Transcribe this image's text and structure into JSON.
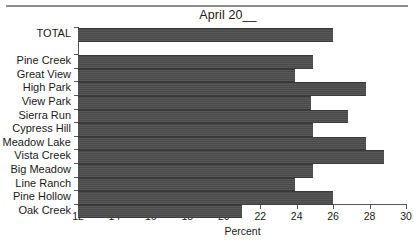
{
  "chart_data": {
    "type": "bar",
    "orientation": "horizontal",
    "title": "April 20__",
    "xlabel": "Percent",
    "ylabel": "",
    "xlim": [
      12,
      30
    ],
    "xticks": [
      12,
      14,
      16,
      18,
      20,
      22,
      24,
      26,
      28,
      30
    ],
    "xtick_labels": [
      "12",
      "14",
      "16",
      "18",
      "20",
      "22",
      "24",
      "26",
      "28",
      "30"
    ],
    "grid": false,
    "legend": null,
    "bar_color": "#4d4d4d",
    "categories": [
      "TOTAL",
      "Pine Creek",
      "Great View",
      "High Park",
      "View Park",
      "Sierra Run",
      "Cypress Hill",
      "Meadow Lake",
      "Vista Creek",
      "Big Meadow",
      "Line Ranch",
      "Pine Hollow",
      "Oak Creek"
    ],
    "values": [
      26.0,
      24.9,
      23.9,
      27.8,
      24.8,
      26.8,
      24.9,
      27.8,
      28.8,
      24.9,
      23.9,
      26.0,
      21.0
    ],
    "bars": [
      {
        "label": "TOTAL",
        "value": 26.0,
        "group": "total"
      },
      {
        "label": "Pine Creek",
        "value": 24.9,
        "group": "items"
      },
      {
        "label": "Great View",
        "value": 23.9,
        "group": "items"
      },
      {
        "label": "High Park",
        "value": 27.8,
        "group": "items"
      },
      {
        "label": "View Park",
        "value": 24.8,
        "group": "items"
      },
      {
        "label": "Sierra Run",
        "value": 26.8,
        "group": "items"
      },
      {
        "label": "Cypress Hill",
        "value": 24.9,
        "group": "items"
      },
      {
        "label": "Meadow Lake",
        "value": 27.8,
        "group": "items"
      },
      {
        "label": "Vista Creek",
        "value": 28.8,
        "group": "items"
      },
      {
        "label": "Big Meadow",
        "value": 24.9,
        "group": "items"
      },
      {
        "label": "Line Ranch",
        "value": 23.9,
        "group": "items"
      },
      {
        "label": "Pine Hollow",
        "value": 26.0,
        "group": "items"
      },
      {
        "label": "Oak Creek",
        "value": 21.0,
        "group": "items"
      }
    ]
  }
}
